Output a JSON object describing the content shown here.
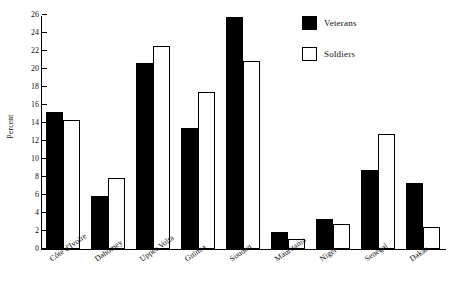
{
  "chart_data": {
    "type": "bar",
    "title": "",
    "xlabel": "",
    "ylabel": "Percent",
    "ylim": [
      0,
      26
    ],
    "ytick_step": 2,
    "yticks": [
      0,
      2,
      4,
      6,
      8,
      10,
      12,
      14,
      16,
      18,
      20,
      22,
      24,
      26
    ],
    "grid": false,
    "legend_position": "top-right",
    "categories": [
      "Côte d'Ivoire",
      "Dahomey",
      "Upper Volta",
      "Guinea",
      "Soudan",
      "Mauritania",
      "Niger",
      "Senegal",
      "Dakar"
    ],
    "series": [
      {
        "name": "Veterans",
        "color": "#000000",
        "style": "filled",
        "values": [
          15.2,
          5.9,
          20.7,
          13.4,
          25.8,
          1.9,
          3.3,
          8.8,
          7.3
        ]
      },
      {
        "name": "Soldiers",
        "color": "#ffffff",
        "style": "hollow",
        "values": [
          14.3,
          7.9,
          22.6,
          17.5,
          20.9,
          1.1,
          2.8,
          12.8,
          2.5
        ]
      }
    ]
  },
  "legend": {
    "items": [
      {
        "label": "Veterans",
        "style": "filled"
      },
      {
        "label": "Soldiers",
        "style": "hollow"
      }
    ]
  }
}
